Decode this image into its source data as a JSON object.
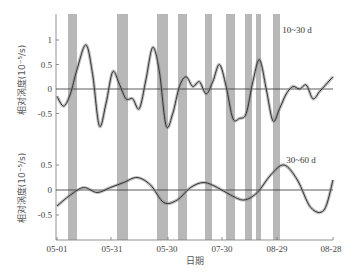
{
  "chart_data": [
    {
      "type": "line",
      "panel": "top",
      "title": "10~30 d",
      "xlabel": "日期",
      "ylabel": "相对涡度(10⁻⁵/s)",
      "yticks": [
        1,
        0.5,
        0,
        -0.5
      ],
      "ylim": [
        -0.9,
        1.35
      ],
      "x_tick_labels": [
        "05-01",
        "05-31",
        "05-30",
        "07-30",
        "08-29",
        "08-28"
      ],
      "shaded_bands_px": [
        [
          68,
          77
        ],
        [
          117,
          128
        ],
        [
          157,
          168
        ],
        [
          178,
          187
        ],
        [
          205,
          212
        ],
        [
          226,
          235
        ],
        [
          245,
          252
        ],
        [
          256,
          261
        ],
        [
          273,
          280
        ]
      ],
      "series": [
        {
          "name": "10~30 d relative vorticity (ensemble mean with spread)",
          "x_day": [
            0,
            3,
            6,
            9,
            13,
            16,
            19,
            22,
            25,
            28,
            31,
            34,
            37,
            40,
            43,
            46,
            49,
            52,
            55,
            58,
            61,
            64,
            67,
            70,
            73,
            76,
            79,
            82,
            85,
            88,
            91,
            94,
            97,
            100,
            103,
            106,
            109,
            112,
            115,
            118,
            121,
            124
          ],
          "values": [
            -0.15,
            -0.35,
            -0.1,
            0.4,
            0.9,
            0.3,
            -0.75,
            -0.3,
            0.35,
            0.1,
            -0.2,
            -0.2,
            -0.4,
            0.2,
            0.85,
            0.35,
            -0.75,
            -0.5,
            0.05,
            0.25,
            0.05,
            0.15,
            -0.1,
            0.15,
            0.5,
            0.05,
            -0.6,
            -0.6,
            -0.5,
            0.15,
            0.6,
            0.0,
            -0.65,
            -0.4,
            -0.1,
            0.05,
            0.0,
            0.08,
            -0.2,
            -0.05,
            0.1,
            0.25
          ]
        }
      ]
    },
    {
      "type": "line",
      "panel": "bottom",
      "title": "30~60 d",
      "xlabel": "日期",
      "ylabel": "相对涡度(10⁻⁵/s)",
      "yticks": [
        0.5,
        0,
        -0.5
      ],
      "ylim": [
        -1.0,
        0.85
      ],
      "x_tick_labels": [
        "05-01",
        "05-31",
        "05-30",
        "07-30",
        "08-29",
        "08-28"
      ],
      "series": [
        {
          "name": "30~60 d relative vorticity (ensemble mean with spread)",
          "x_day": [
            0,
            6,
            12,
            18,
            24,
            30,
            36,
            42,
            48,
            54,
            60,
            66,
            72,
            78,
            84,
            90,
            96,
            102,
            108,
            114,
            120,
            124
          ],
          "values": [
            -0.32,
            -0.1,
            0.05,
            -0.05,
            0.05,
            0.15,
            0.25,
            0.1,
            -0.25,
            -0.2,
            0.05,
            0.15,
            0.05,
            -0.1,
            -0.2,
            -0.05,
            0.3,
            0.5,
            0.2,
            -0.35,
            -0.4,
            0.2
          ]
        }
      ]
    }
  ],
  "labels": {
    "top_panel": "10~30 d",
    "bottom_panel": "30~60 d",
    "y_axis": "相对涡度(10⁻⁵/s)",
    "x_axis": "日期",
    "yticks_top": [
      "1",
      "0.5",
      "0",
      "-0.5"
    ],
    "yticks_bottom": [
      "0.5",
      "0",
      "-0.5"
    ],
    "xticks": [
      "05-01",
      "05-31",
      "05-30",
      "07-30",
      "08-29",
      "08-28"
    ]
  },
  "colors": {
    "band": "#b8b8b8",
    "line": "#333333",
    "spread": "#888888",
    "axis": "#666666"
  }
}
